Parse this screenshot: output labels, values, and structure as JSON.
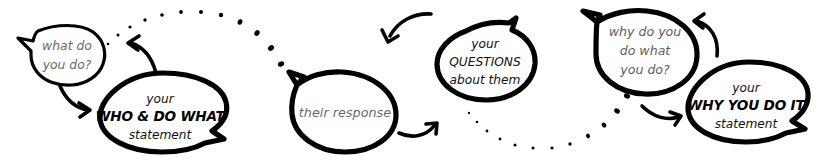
{
  "diagram": {
    "ink_color": "#000000",
    "muted_text_color": "#6a6a6a",
    "background_color": "#ffffff",
    "stages": [
      {
        "id": "stage-1",
        "prompt_bubble": {
          "name": "what-do-you-do-bubble",
          "style": "thin-outline",
          "tail": "down-left",
          "lines": [
            "what do",
            "you do?"
          ]
        },
        "answer_bubble": {
          "name": "who-and-do-what-statement-bubble",
          "style": "thick-outline",
          "tail": "down-right",
          "lines": [
            "your",
            "WHO & DO WHAT",
            "statement"
          ],
          "emphasis_line_index": 1
        }
      },
      {
        "id": "stage-2",
        "response_bubble": {
          "name": "their-response-bubble",
          "style": "thick-outline",
          "tail": "up-left",
          "lines": [
            "their response"
          ]
        },
        "questions_bubble": {
          "name": "your-questions-about-them-bubble",
          "style": "thick-outline",
          "tail": "up-right",
          "lines": [
            "your",
            "QUESTIONS",
            "about them"
          ],
          "emphasis_line_index": 1
        }
      },
      {
        "id": "stage-3",
        "prompt_bubble": {
          "name": "why-do-you-do-what-you-do-bubble",
          "style": "thick-outline",
          "tail": "up-left",
          "lines": [
            "why do you",
            "do what",
            "you do?"
          ]
        },
        "answer_bubble": {
          "name": "why-you-do-it-statement-bubble",
          "style": "thick-outline",
          "tail": "down-right",
          "lines": [
            "your",
            "WHY YOU DO IT",
            "statement"
          ],
          "emphasis_line_index": 1
        }
      }
    ],
    "connectors": [
      {
        "name": "arrow-question-to-statement-1",
        "kind": "curved-arrow",
        "direction": "right"
      },
      {
        "name": "arrow-statement-1-upward",
        "kind": "curved-arrow",
        "direction": "up-left"
      },
      {
        "name": "dotted-arc-stage1-to-stage2",
        "kind": "dotted-arc",
        "curvature": "over"
      },
      {
        "name": "arrow-into-questions-bubble",
        "kind": "curved-arrow",
        "direction": "down-left"
      },
      {
        "name": "arrow-response-to-next",
        "kind": "curved-arrow",
        "direction": "up-right"
      },
      {
        "name": "dotted-arc-stage2-to-stage3",
        "kind": "dotted-arc",
        "curvature": "under"
      },
      {
        "name": "arrow-into-why-question-bubble",
        "kind": "curved-arrow",
        "direction": "up-left"
      },
      {
        "name": "arrow-question-to-statement-3",
        "kind": "curved-arrow",
        "direction": "right"
      }
    ]
  }
}
